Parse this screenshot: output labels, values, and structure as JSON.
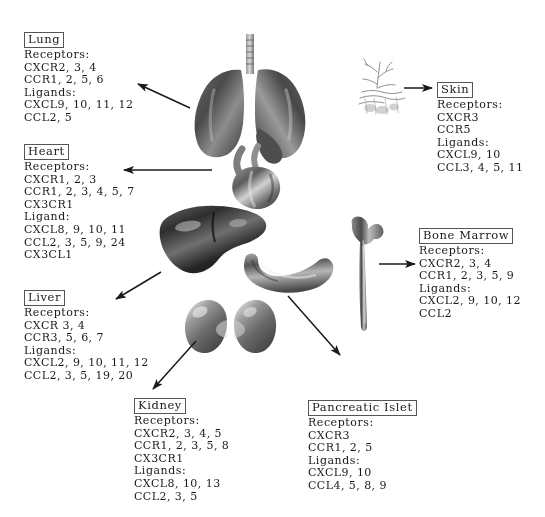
{
  "figure": {
    "background": "#ffffff",
    "ink": "#1a1a1a",
    "box_border": "#555555"
  },
  "blocks": [
    {
      "id": "lung",
      "title": "Lung",
      "lines": [
        "Receptors:",
        "CXCR2, 3, 4",
        "CCR1, 2, 5, 6",
        "Ligands:",
        "CXCL9, 10, 11, 12",
        "CCL2, 5"
      ]
    },
    {
      "id": "heart",
      "title": "Heart",
      "lines": [
        "Receptors:",
        "CXCR1, 2, 3",
        "CCR1, 2, 3, 4, 5, 7",
        "CX3CR1",
        "Ligand:",
        "CXCL8, 9, 10, 11",
        "CCL2, 3, 5, 9, 24",
        "CX3CL1"
      ]
    },
    {
      "id": "liver",
      "title": "Liver",
      "lines": [
        "Receptors:",
        "CXCR 3, 4",
        "CCR3, 5, 6, 7",
        "Ligands:",
        "CXCL2, 9, 10, 11, 12",
        "CCL2, 3, 5, 19, 20"
      ]
    },
    {
      "id": "kidney",
      "title": "Kidney",
      "lines": [
        "Receptors:",
        "CXCR2, 3, 4, 5",
        "CCR1, 2, 3, 5, 8",
        "CX3CR1",
        "Ligands:",
        "CXCL8, 10, 13",
        "CCL2, 3, 5"
      ]
    },
    {
      "id": "pancreatic-islet",
      "title": "Pancreatic Islet",
      "lines": [
        "Receptors:",
        "CXCR3",
        "CCR1, 2, 5",
        "Ligands:",
        "CXCL9, 10",
        "CCL4, 5, 8, 9"
      ]
    },
    {
      "id": "bone-marrow",
      "title": "Bone Marrow",
      "lines": [
        "Receptors:",
        "CXCR2, 3, 4",
        "CCR1, 2, 3, 5, 9",
        "Ligands:",
        "CXCL2, 9, 10, 12",
        "CCL2"
      ]
    },
    {
      "id": "skin",
      "title": "Skin",
      "lines": [
        "Receptors:",
        "CXCR3",
        "CCR5",
        "Ligands:",
        "CXCL9, 10",
        "CCL3, 4, 5, 11"
      ]
    }
  ],
  "organs": [
    {
      "id": "lungs",
      "label": "lungs-illustration"
    },
    {
      "id": "heart",
      "label": "heart-illustration"
    },
    {
      "id": "liver",
      "label": "liver-illustration"
    },
    {
      "id": "pancreas",
      "label": "pancreas-illustration"
    },
    {
      "id": "kidneys",
      "label": "kidneys-illustration"
    },
    {
      "id": "femur",
      "label": "femur-bone-illustration"
    },
    {
      "id": "skin",
      "label": "skin-tissue-illustration"
    }
  ],
  "arrows": [
    {
      "id": "lungs-to-lung",
      "from": "lungs",
      "to": "lung"
    },
    {
      "id": "heart-to-heart",
      "from": "heart",
      "to": "heart"
    },
    {
      "id": "liver-to-liver",
      "from": "liver",
      "to": "liver"
    },
    {
      "id": "kidneys-to-kidney",
      "from": "kidneys",
      "to": "kidney"
    },
    {
      "id": "pancreas-to-pancreatic-islet",
      "from": "pancreas",
      "to": "pancreatic-islet"
    },
    {
      "id": "femur-to-bone-marrow",
      "from": "femur",
      "to": "bone-marrow"
    },
    {
      "id": "skin-to-skin",
      "from": "skin",
      "to": "skin"
    }
  ]
}
